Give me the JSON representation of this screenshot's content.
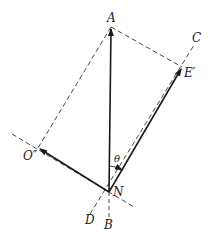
{
  "diagram": {
    "type": "vector-resolution",
    "labels": {
      "A": "A",
      "C": "C",
      "E_prime": "E′",
      "O_double_prime": "O″",
      "N": "N",
      "D": "D",
      "B": "B",
      "theta": "θ"
    },
    "points": {
      "A": [
        111,
        27
      ],
      "N": [
        109,
        192
      ],
      "E_prime": [
        182,
        67
      ],
      "O_double_prime": [
        38,
        148
      ]
    },
    "vectors": [
      {
        "from": "N",
        "to": "A",
        "style": "solid-arrow"
      },
      {
        "from": "N",
        "to": "E_prime",
        "style": "solid-arrow"
      },
      {
        "from": "N",
        "to": "O_double_prime",
        "style": "solid-arrow"
      }
    ],
    "dashed_lines": [
      {
        "from": "A",
        "to": "E_prime"
      },
      {
        "from": "A",
        "to": "O_double_prime"
      },
      {
        "name": "axis-D-C",
        "from": [
          90,
          214
        ],
        "to": [
          194,
          45
        ]
      },
      {
        "name": "axis-O-N",
        "from": [
          12,
          134
        ],
        "to": [
          134,
          207
        ]
      },
      {
        "name": "axis-N-B",
        "from": [
          109,
          192
        ],
        "to": [
          109,
          220
        ]
      }
    ],
    "angle": {
      "label": "θ",
      "between": [
        "NA",
        "NE′"
      ]
    },
    "colors": {
      "stroke": "#1a1a1a",
      "dashed": "#333333"
    }
  }
}
